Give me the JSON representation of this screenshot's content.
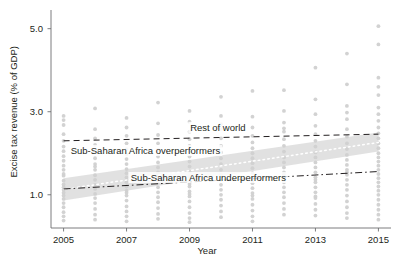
{
  "chart_data": {
    "type": "scatter",
    "title": "",
    "xlabel": "Year",
    "ylabel": "Excise tax revenue (% of GDP)",
    "xlim": [
      2004.6,
      2015.4
    ],
    "ylim": [
      0.2,
      5.45
    ],
    "grid": false,
    "legend_position": "inline-annotations",
    "xticks": [
      "2005",
      "2007",
      "2009",
      "2011",
      "2013",
      "2015"
    ],
    "xtick_values": [
      2005,
      2007,
      2009,
      2011,
      2013,
      2015
    ],
    "yticks": [
      "1.0",
      "3.0",
      "5.0"
    ],
    "ytick_values": [
      1.0,
      3.0,
      5.0
    ],
    "point_color": "#d0d0d0",
    "band_color": "#dcdcdc",
    "line_color": "#231f20",
    "annotations": [
      {
        "id": "rest-of-world",
        "label": "Rest of world",
        "x": 2009.9,
        "y": 2.62
      },
      {
        "id": "ssa-overperformers",
        "label": "Sub-Saharan Africa overperformers",
        "x": 2007.6,
        "y": 2.06
      },
      {
        "id": "ssa-underperformers",
        "label": "Sub-Saharan Africa underperformers",
        "x": 2009.6,
        "y": 1.4
      }
    ],
    "series": [
      {
        "name": "Rest of world",
        "style": "dashed",
        "x": [
          2005,
          2015
        ],
        "values": [
          2.3,
          2.46
        ]
      },
      {
        "name": "Sub-Saharan Africa overperformers",
        "style": "dotted-with-band",
        "x": [
          2005,
          2015
        ],
        "values": [
          1.13,
          2.26
        ],
        "band_lower": [
          0.86,
          2.04
        ],
        "band_upper": [
          1.4,
          2.5
        ]
      },
      {
        "name": "Sub-Saharan Africa underperformers",
        "style": "dash-dot",
        "x": [
          2005,
          2015
        ],
        "values": [
          1.14,
          1.56
        ]
      }
    ],
    "scatter_points": [
      [
        2005,
        2.9
      ],
      [
        2005,
        2.8
      ],
      [
        2005,
        2.68
      ],
      [
        2005,
        2.46
      ],
      [
        2005,
        2.3
      ],
      [
        2005,
        2.16
      ],
      [
        2005,
        2.05
      ],
      [
        2005,
        1.93
      ],
      [
        2005,
        1.82
      ],
      [
        2005,
        1.7
      ],
      [
        2005,
        1.6
      ],
      [
        2005,
        1.46
      ],
      [
        2005,
        1.34
      ],
      [
        2005,
        1.25
      ],
      [
        2005,
        1.18
      ],
      [
        2005,
        1.12
      ],
      [
        2005,
        1.05
      ],
      [
        2005,
        0.98
      ],
      [
        2005,
        0.9
      ],
      [
        2005,
        0.8
      ],
      [
        2005,
        0.7
      ],
      [
        2005,
        0.58
      ],
      [
        2005,
        0.48
      ],
      [
        2005,
        0.38
      ],
      [
        2006,
        2.58
      ],
      [
        2006,
        2.36
      ],
      [
        2006,
        2.2
      ],
      [
        2006,
        2.02
      ],
      [
        2006,
        1.88
      ],
      [
        2006,
        1.74
      ],
      [
        2006,
        1.6
      ],
      [
        2006,
        1.47
      ],
      [
        2006,
        1.36
      ],
      [
        2006,
        1.24
      ],
      [
        2006,
        1.14
      ],
      [
        2006,
        1.02
      ],
      [
        2006,
        0.92
      ],
      [
        2006,
        0.8
      ],
      [
        2006,
        0.66
      ],
      [
        2006,
        0.52
      ],
      [
        2006,
        0.4
      ],
      [
        2007,
        2.85
      ],
      [
        2007,
        2.62
      ],
      [
        2007,
        2.42
      ],
      [
        2007,
        2.24
      ],
      [
        2007,
        2.1
      ],
      [
        2007,
        1.98
      ],
      [
        2007,
        1.86
      ],
      [
        2007,
        1.74
      ],
      [
        2007,
        1.62
      ],
      [
        2007,
        1.52
      ],
      [
        2007,
        1.42
      ],
      [
        2007,
        1.3
      ],
      [
        2007,
        1.2
      ],
      [
        2007,
        1.1
      ],
      [
        2007,
        0.98
      ],
      [
        2007,
        0.86
      ],
      [
        2007,
        0.72
      ],
      [
        2007,
        0.6
      ],
      [
        2007,
        0.48
      ],
      [
        2007,
        0.36
      ],
      [
        2008,
        2.72
      ],
      [
        2008,
        2.44
      ],
      [
        2008,
        2.24
      ],
      [
        2008,
        2.08
      ],
      [
        2008,
        1.92
      ],
      [
        2008,
        1.78
      ],
      [
        2008,
        1.66
      ],
      [
        2008,
        1.54
      ],
      [
        2008,
        1.42
      ],
      [
        2008,
        1.3
      ],
      [
        2008,
        1.18
      ],
      [
        2008,
        1.06
      ],
      [
        2008,
        0.94
      ],
      [
        2008,
        0.82
      ],
      [
        2008,
        0.68
      ],
      [
        2008,
        0.54
      ],
      [
        2008,
        0.42
      ],
      [
        2009,
        3.02
      ],
      [
        2009,
        2.76
      ],
      [
        2009,
        2.52
      ],
      [
        2009,
        2.34
      ],
      [
        2009,
        2.18
      ],
      [
        2009,
        2.04
      ],
      [
        2009,
        1.92
      ],
      [
        2009,
        1.8
      ],
      [
        2009,
        1.68
      ],
      [
        2009,
        1.56
      ],
      [
        2009,
        1.44
      ],
      [
        2009,
        1.32
      ],
      [
        2009,
        1.2
      ],
      [
        2009,
        1.08
      ],
      [
        2009,
        0.96
      ],
      [
        2009,
        0.84
      ],
      [
        2009,
        0.7
      ],
      [
        2009,
        0.56
      ],
      [
        2009,
        0.44
      ],
      [
        2009,
        0.34
      ],
      [
        2010,
        3.36
      ],
      [
        2010,
        2.9
      ],
      [
        2010,
        2.58
      ],
      [
        2010,
        2.36
      ],
      [
        2010,
        2.18
      ],
      [
        2010,
        2.02
      ],
      [
        2010,
        1.88
      ],
      [
        2010,
        1.74
      ],
      [
        2010,
        1.6
      ],
      [
        2010,
        1.48
      ],
      [
        2010,
        1.36
      ],
      [
        2010,
        1.24
      ],
      [
        2010,
        1.12
      ],
      [
        2010,
        1.0
      ],
      [
        2010,
        0.88
      ],
      [
        2010,
        0.74
      ],
      [
        2010,
        0.6
      ],
      [
        2010,
        0.46
      ],
      [
        2011,
        3.5
      ],
      [
        2011,
        2.88
      ],
      [
        2011,
        2.62
      ],
      [
        2011,
        2.42
      ],
      [
        2011,
        2.26
      ],
      [
        2011,
        2.12
      ],
      [
        2011,
        2.0
      ],
      [
        2011,
        1.88
      ],
      [
        2011,
        1.76
      ],
      [
        2011,
        1.64
      ],
      [
        2011,
        1.52
      ],
      [
        2011,
        1.4
      ],
      [
        2011,
        1.28
      ],
      [
        2011,
        1.16
      ],
      [
        2011,
        1.04
      ],
      [
        2011,
        0.9
      ],
      [
        2011,
        0.76
      ],
      [
        2011,
        0.62
      ],
      [
        2011,
        0.48
      ],
      [
        2011,
        0.36
      ],
      [
        2012,
        3.52
      ],
      [
        2012,
        3.02
      ],
      [
        2012,
        2.74
      ],
      [
        2012,
        2.52
      ],
      [
        2012,
        2.34
      ],
      [
        2012,
        2.18
      ],
      [
        2012,
        2.04
      ],
      [
        2012,
        1.9
      ],
      [
        2012,
        1.78
      ],
      [
        2012,
        1.66
      ],
      [
        2012,
        1.54
      ],
      [
        2012,
        1.42
      ],
      [
        2012,
        1.3
      ],
      [
        2012,
        1.18
      ],
      [
        2012,
        1.06
      ],
      [
        2012,
        0.94
      ],
      [
        2012,
        0.8
      ],
      [
        2012,
        0.66
      ],
      [
        2012,
        0.52
      ],
      [
        2013,
        4.06
      ],
      [
        2013,
        3.3
      ],
      [
        2013,
        2.94
      ],
      [
        2013,
        2.66
      ],
      [
        2013,
        2.46
      ],
      [
        2013,
        2.3
      ],
      [
        2013,
        2.16
      ],
      [
        2013,
        2.02
      ],
      [
        2013,
        1.9
      ],
      [
        2013,
        1.78
      ],
      [
        2013,
        1.66
      ],
      [
        2013,
        1.54
      ],
      [
        2013,
        1.42
      ],
      [
        2013,
        1.3
      ],
      [
        2013,
        1.18
      ],
      [
        2013,
        1.06
      ],
      [
        2013,
        0.92
      ],
      [
        2013,
        0.78
      ],
      [
        2013,
        0.64
      ],
      [
        2013,
        0.5
      ],
      [
        2014,
        4.4
      ],
      [
        2014,
        3.66
      ],
      [
        2014,
        3.14
      ],
      [
        2014,
        2.82
      ],
      [
        2014,
        2.58
      ],
      [
        2014,
        2.4
      ],
      [
        2014,
        2.24
      ],
      [
        2014,
        2.1
      ],
      [
        2014,
        1.96
      ],
      [
        2014,
        1.84
      ],
      [
        2014,
        1.72
      ],
      [
        2014,
        1.6
      ],
      [
        2014,
        1.48
      ],
      [
        2014,
        1.36
      ],
      [
        2014,
        1.24
      ],
      [
        2014,
        1.12
      ],
      [
        2014,
        0.98
      ],
      [
        2014,
        0.84
      ],
      [
        2014,
        0.7
      ],
      [
        2014,
        0.56
      ],
      [
        2014,
        0.44
      ],
      [
        2015,
        5.06
      ],
      [
        2015,
        4.62
      ],
      [
        2015,
        3.82
      ],
      [
        2015,
        3.4
      ],
      [
        2015,
        3.1
      ],
      [
        2015,
        2.94
      ],
      [
        2015,
        2.78
      ],
      [
        2015,
        2.62
      ],
      [
        2015,
        2.48
      ],
      [
        2015,
        2.36
      ],
      [
        2015,
        2.24
      ],
      [
        2015,
        2.12
      ],
      [
        2015,
        2.0
      ],
      [
        2015,
        1.9
      ],
      [
        2015,
        1.8
      ],
      [
        2015,
        1.7
      ],
      [
        2015,
        1.6
      ],
      [
        2015,
        1.5
      ],
      [
        2015,
        1.4
      ],
      [
        2015,
        1.3
      ],
      [
        2015,
        1.2
      ],
      [
        2015,
        1.1
      ],
      [
        2015,
        1.0
      ],
      [
        2015,
        0.88
      ],
      [
        2015,
        0.76
      ],
      [
        2015,
        0.64
      ],
      [
        2015,
        0.52
      ],
      [
        2015,
        0.4
      ],
      [
        2006,
        3.08
      ],
      [
        2008,
        3.22
      ],
      [
        2010,
        2.7
      ],
      [
        2012,
        2.6
      ],
      [
        2014,
        2.98
      ],
      [
        2007,
        1.05
      ],
      [
        2009,
        1.02
      ],
      [
        2011,
        0.98
      ],
      [
        2013,
        0.96
      ],
      [
        2015,
        3.6
      ],
      [
        2006,
        1.68
      ],
      [
        2008,
        1.5
      ],
      [
        2010,
        1.44
      ],
      [
        2012,
        1.48
      ],
      [
        2014,
        1.54
      ],
      [
        2005,
        1.5
      ],
      [
        2007,
        1.36
      ],
      [
        2009,
        1.26
      ],
      [
        2011,
        1.34
      ],
      [
        2013,
        1.36
      ]
    ]
  }
}
